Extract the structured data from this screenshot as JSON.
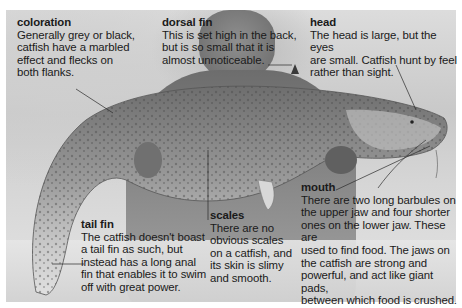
{
  "image": {
    "subject": "Catfish held by a person, annotated",
    "colors": {
      "text": "#1a1a1a",
      "background": "#ffffff",
      "leader_lines": "#2a2a2a"
    }
  },
  "annotations": [
    {
      "id": "coloration",
      "title": "coloration",
      "body": "Generally grey or black,\ncatfish have a marbled\neffect and flecks on\nboth flanks."
    },
    {
      "id": "dorsal_fin",
      "title": "dorsal fin",
      "body": "This is set high in the back,\nbut is so small that it is\nalmost unnoticeable."
    },
    {
      "id": "head",
      "title": "head",
      "body": "The head is large, but the eyes\nare small. Catfish hunt by feel\nrather than sight."
    },
    {
      "id": "mouth",
      "title": "mouth",
      "body": "There are two long barbules on\nthe upper jaw and four shorter\nones on the lower jaw. These are\nused to find food. The jaws on\nthe catfish are strong and\npowerful, and act like giant pads,\nbetween which food is crushed."
    },
    {
      "id": "scales",
      "title": "scales",
      "body": "There are no\nobvious scales\non a catfish, and\nits skin is slimy\nand smooth."
    },
    {
      "id": "tail_fin",
      "title": "tail fin",
      "body": "The catfish doesn't boast\na tail fin as such, but\ninstead has a long anal\nfin that enables it to swim\noff with great power."
    }
  ]
}
